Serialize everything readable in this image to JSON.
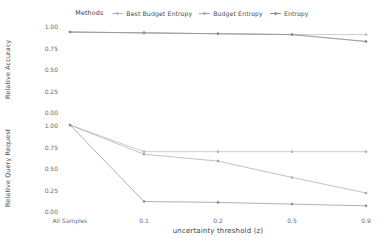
{
  "legend": {
    "title": "Methods",
    "entries": [
      {
        "label": "Best Budget Entropy",
        "color": "#b8b8b8",
        "key": "line-marker-key"
      },
      {
        "label": "Budget Entropy",
        "color": "#a8a8a8",
        "key": "line-marker-key"
      },
      {
        "label": "Entropy",
        "color": "#8f8f8f",
        "key": "line-marker-key"
      }
    ]
  },
  "axes": {
    "x_title": "uncertainty threshold (z)",
    "x_ticks": [
      "All Samples",
      "0.1",
      "0.2",
      "0.5",
      "0.9"
    ],
    "y_ticks": [
      "1.00",
      "0.75",
      "0.50",
      "0.25",
      "0.00"
    ],
    "y_title_top": "Relative Accuracy",
    "y_title_bottom": "Relative Query Request"
  },
  "chart_data": [
    {
      "type": "line",
      "title": "Relative Accuracy",
      "panel": "top",
      "xlabel": "uncertainty threshold (z)",
      "ylabel": "Relative Accuracy",
      "categories": [
        "All Samples",
        "0.1",
        "0.2",
        "0.5",
        "0.9"
      ],
      "ylim": [
        0,
        1
      ],
      "yticks": [
        0.0,
        0.25,
        0.5,
        0.75,
        1.0
      ],
      "grid": false,
      "legend_position": "top-center",
      "series": [
        {
          "name": "Best Budget Entropy",
          "color": "#b8b8b8",
          "values": [
            0.93,
            0.92,
            0.91,
            0.9,
            0.9
          ]
        },
        {
          "name": "Budget Entropy",
          "color": "#a8a8a8",
          "values": [
            0.93,
            0.92,
            0.91,
            0.9,
            0.82
          ]
        },
        {
          "name": "Entropy",
          "color": "#8f8f8f",
          "values": [
            0.93,
            0.92,
            0.91,
            0.9,
            0.82
          ]
        }
      ]
    },
    {
      "type": "line",
      "title": "Relative Query Request",
      "panel": "bottom",
      "xlabel": "uncertainty threshold (z)",
      "ylabel": "Relative Query Request",
      "categories": [
        "All Samples",
        "0.1",
        "0.2",
        "0.5",
        "0.9"
      ],
      "ylim": [
        0,
        1
      ],
      "yticks": [
        0.0,
        0.25,
        0.5,
        0.75,
        1.0
      ],
      "grid": false,
      "legend_position": "top-center",
      "series": [
        {
          "name": "Best Budget Entropy",
          "color": "#b8b8b8",
          "values": [
            1.0,
            0.69,
            0.69,
            0.69,
            0.69
          ]
        },
        {
          "name": "Budget Entropy",
          "color": "#a8a8a8",
          "values": [
            1.0,
            0.66,
            0.58,
            0.39,
            0.21
          ]
        },
        {
          "name": "Entropy",
          "color": "#8f8f8f",
          "values": [
            1.0,
            0.11,
            0.1,
            0.08,
            0.06
          ]
        }
      ]
    }
  ]
}
